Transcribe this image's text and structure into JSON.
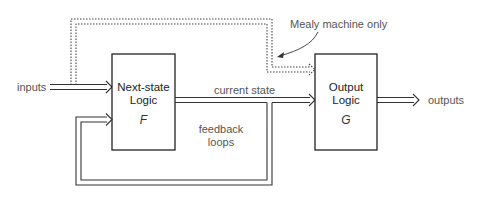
{
  "diagram": {
    "blocks": [
      {
        "id": "next_state",
        "line1": "Next-state",
        "line2": "Logic",
        "function": "F"
      },
      {
        "id": "output",
        "line1": "Output",
        "line2": "Logic",
        "function": "G"
      }
    ],
    "labels": {
      "inputs": "inputs",
      "outputs": "outputs",
      "current_state": "current state",
      "feedback_line1": "feedback",
      "feedback_line2": "loops",
      "mealy_note": "Mealy machine only"
    },
    "connections": [
      {
        "from": "inputs",
        "to": "next_state",
        "style": "double-line arrow"
      },
      {
        "from": "inputs",
        "to": "output",
        "style": "dotted double-line arrow",
        "note": "Mealy machine only"
      },
      {
        "from": "next_state",
        "to": "output",
        "label": "current state",
        "style": "double-line arrow"
      },
      {
        "from": "current_state",
        "to": "next_state",
        "label": "feedback loops",
        "style": "double-line arrow"
      },
      {
        "from": "output",
        "to": "outputs",
        "style": "double-line arrow"
      }
    ],
    "colors": {
      "stroke": "#333333",
      "text": "#555555",
      "background": "#ffffff"
    }
  }
}
